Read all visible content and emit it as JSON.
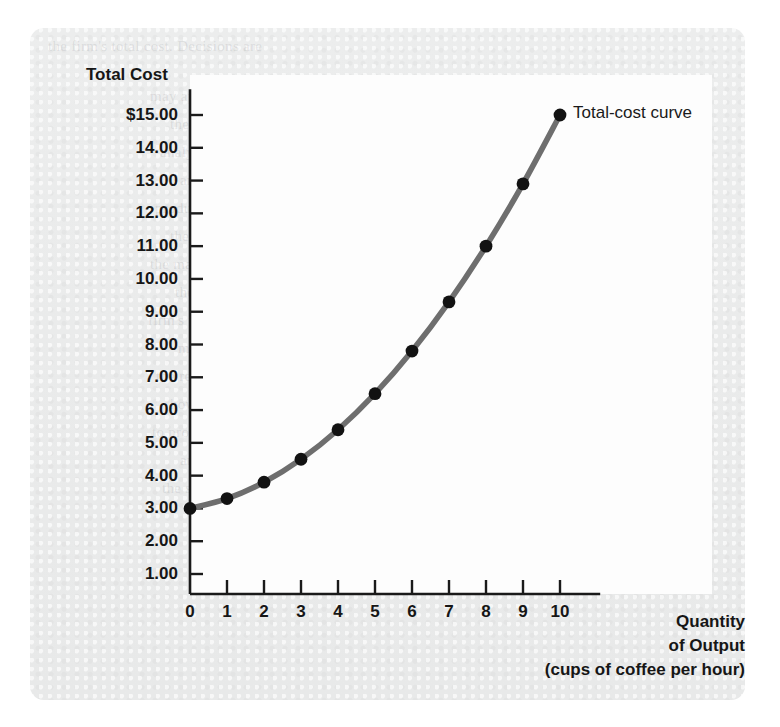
{
  "figure": {
    "background_color": "#eaebeb",
    "plot_background_color": "#fdfdfd",
    "axis_color": "#1a1a1a",
    "curve_color": "#6e6e6e",
    "marker_color": "#121212"
  },
  "chart_data": {
    "type": "line",
    "title": "",
    "xlabel": "Quantity of Output (cups of coffee per hour)",
    "ylabel": "Total Cost",
    "x": [
      0,
      1,
      2,
      3,
      4,
      5,
      6,
      7,
      8,
      9,
      10
    ],
    "values": [
      3.0,
      3.3,
      3.8,
      4.5,
      5.4,
      6.5,
      7.8,
      9.3,
      11.0,
      12.9,
      15.0
    ],
    "series": [
      {
        "name": "Total-cost curve",
        "values": [
          3.0,
          3.3,
          3.8,
          4.5,
          5.4,
          6.5,
          7.8,
          9.3,
          11.0,
          12.9,
          15.0
        ]
      }
    ],
    "xlim": [
      0,
      10.6
    ],
    "ylim": [
      0,
      15.6
    ],
    "grid": false,
    "legend_position": "inline-annotation",
    "annotations": [
      {
        "text": "Total-cost curve",
        "x": 10,
        "y": 15.0
      }
    ],
    "xtick_labels": [
      "0",
      "1",
      "2",
      "3",
      "4",
      "5",
      "6",
      "7",
      "8",
      "9",
      "10"
    ],
    "xtick_values": [
      0,
      1,
      2,
      3,
      4,
      5,
      6,
      7,
      8,
      9,
      10
    ],
    "ytick_labels": [
      "$15.00",
      "14.00",
      "13.00",
      "12.00",
      "11.00",
      "10.00",
      "9.00",
      "8.00",
      "7.00",
      "6.00",
      "5.00",
      "4.00",
      "3.00",
      "2.00",
      "1.00"
    ],
    "ytick_values": [
      15,
      14,
      13,
      12,
      11,
      10,
      9,
      8,
      7,
      6,
      5,
      4,
      3,
      2,
      1
    ]
  },
  "labels": {
    "y_axis_title": "Total Cost",
    "x_axis_title_line1": "Quantity",
    "x_axis_title_line2": "of Output",
    "x_axis_title_line3": "(cups of coffee per hour)",
    "series_annotation": "Total-cost curve"
  },
  "ghost_text": [
    "the firm's total cost. Decisions are",
    "may apply to the firm's output.",
    "the firm's costs and revenue",
    "analyze the tradeoffs involved",
    "and competitive markets",
    "production function shows",
    "the quantity of output produced",
    "the marginal product of labor",
    "the cost of the production",
    "firm's total revenue, total cost,",
    "marginal cost and average",
    "the relationship between",
    "how the firm decides how much",
    "to produce in the short run",
    "and in the long run",
    "the shape of the cost curves"
  ]
}
